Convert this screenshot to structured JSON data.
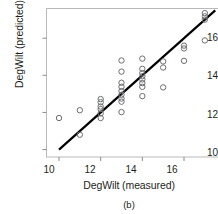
{
  "chart_data": {
    "type": "scatter",
    "title": "",
    "xlabel": "DegWilt (measured)",
    "ylabel": "DegWilt (predicted)",
    "caption": "(b)",
    "xlim": [
      9.4,
      17.8
    ],
    "ylim": [
      9.6,
      17.6
    ],
    "xticks": [
      10,
      12,
      14,
      16
    ],
    "yticks": [
      10,
      12,
      14,
      16
    ],
    "grid": false,
    "legend": null,
    "marker": "open-circle",
    "marker_color": "#6d6e71",
    "reference_line": {
      "name": "1:1 line",
      "color": "#000000",
      "x": [
        10.0,
        17.5
      ],
      "y": [
        10.0,
        17.5
      ]
    },
    "points": [
      {
        "x": 10.0,
        "y": 11.7
      },
      {
        "x": 11.0,
        "y": 12.12
      },
      {
        "x": 11.0,
        "y": 10.8
      },
      {
        "x": 12.0,
        "y": 12.72
      },
      {
        "x": 12.0,
        "y": 12.55
      },
      {
        "x": 12.0,
        "y": 12.32
      },
      {
        "x": 12.0,
        "y": 12.18
      },
      {
        "x": 12.0,
        "y": 11.95
      },
      {
        "x": 12.0,
        "y": 11.7
      },
      {
        "x": 13.0,
        "y": 14.8
      },
      {
        "x": 13.0,
        "y": 14.2
      },
      {
        "x": 13.0,
        "y": 13.6
      },
      {
        "x": 13.0,
        "y": 13.38
      },
      {
        "x": 13.0,
        "y": 13.15
      },
      {
        "x": 13.0,
        "y": 12.95
      },
      {
        "x": 13.0,
        "y": 12.75
      },
      {
        "x": 13.0,
        "y": 12.58
      },
      {
        "x": 13.0,
        "y": 12.02
      },
      {
        "x": 14.0,
        "y": 14.9
      },
      {
        "x": 14.0,
        "y": 14.35
      },
      {
        "x": 14.0,
        "y": 14.12
      },
      {
        "x": 14.0,
        "y": 13.95
      },
      {
        "x": 14.0,
        "y": 13.78
      },
      {
        "x": 14.0,
        "y": 13.58
      },
      {
        "x": 14.0,
        "y": 13.38
      },
      {
        "x": 14.0,
        "y": 12.88
      },
      {
        "x": 15.0,
        "y": 14.75
      },
      {
        "x": 15.0,
        "y": 14.42
      },
      {
        "x": 15.0,
        "y": 13.35
      },
      {
        "x": 16.0,
        "y": 15.6
      },
      {
        "x": 16.0,
        "y": 15.45
      },
      {
        "x": 16.0,
        "y": 14.78
      },
      {
        "x": 17.0,
        "y": 17.35
      },
      {
        "x": 17.0,
        "y": 17.18
      },
      {
        "x": 17.0,
        "y": 17.0
      },
      {
        "x": 17.0,
        "y": 15.88
      }
    ]
  },
  "axis": {
    "y_tick_labels": [
      "16",
      "14",
      "12",
      "10"
    ],
    "x_tick_labels": [
      "10",
      "12",
      "14",
      "16"
    ]
  },
  "labels": {
    "ylabel": "DegWilt (predicted)",
    "xlabel": "DegWilt (measured)",
    "caption": "(b)"
  }
}
